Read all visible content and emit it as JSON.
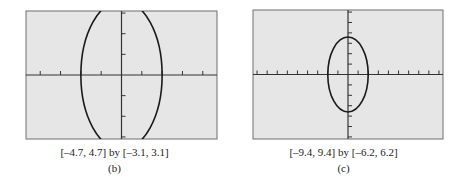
{
  "chart_data": [
    {
      "type": "line",
      "panel_label": "(b)",
      "window_label": "[–4.7, 4.7] by [–3.1, 3.1]",
      "xlim": [
        -4.7,
        4.7
      ],
      "ylim": [
        -3.1,
        3.1
      ],
      "xtick_step": 1,
      "ytick_step": 1,
      "grid": false,
      "background": "#e6e6e6",
      "curve": {
        "shape": "ellipse",
        "center": [
          0,
          0
        ],
        "semi_x": 2,
        "semi_y": 3.6,
        "clipped_by_window": true
      }
    },
    {
      "type": "line",
      "panel_label": "(c)",
      "window_label": "[–9.4, 9.4] by [–6.2, 6.2]",
      "xlim": [
        -9.4,
        9.4
      ],
      "ylim": [
        -6.2,
        6.2
      ],
      "xtick_step": 1,
      "ytick_step": 1,
      "grid": false,
      "background": "#e6e6e6",
      "curve": {
        "shape": "ellipse",
        "center": [
          0,
          0
        ],
        "semi_x": 2,
        "semi_y": 3.6,
        "clipped_by_window": false
      }
    }
  ],
  "panels": [
    {
      "letter": "(b)",
      "window": "[–4.7, 4.7] by [–3.1, 3.1]"
    },
    {
      "letter": "(c)",
      "window": "[–9.4, 9.4] by [–6.2, 6.2]"
    }
  ],
  "colors": {
    "screen": "#e6e6e6",
    "border": "#6e6e6e",
    "axis": "#333333",
    "curve": "#1a1a1a"
  }
}
